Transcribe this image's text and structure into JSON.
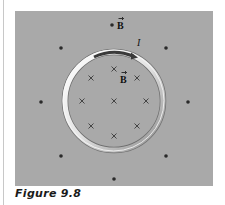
{
  "figure": {
    "caption": "Figure 9.8",
    "background_color": "#a9a9a9",
    "labels": {
      "field_outside": "B",
      "field_inside": "B",
      "current": "I"
    },
    "symbols": {
      "outside": "dot (field out of page)",
      "inside": "cross (field into page)"
    },
    "ring": {
      "center": [
        114,
        101
      ],
      "radius": 49,
      "color": "#e8e8e8"
    },
    "dots": [
      [
        61,
        48
      ],
      [
        41,
        102
      ],
      [
        61,
        156
      ],
      [
        114,
        24
      ],
      [
        166,
        48
      ],
      [
        188,
        102
      ],
      [
        166,
        156
      ],
      [
        114,
        179
      ]
    ],
    "crosses": [
      [
        114,
        69
      ],
      [
        91,
        78
      ],
      [
        137,
        78
      ],
      [
        82,
        101
      ],
      [
        114,
        101
      ],
      [
        146,
        101
      ],
      [
        91,
        126
      ],
      [
        137,
        126
      ],
      [
        114,
        136
      ]
    ]
  }
}
